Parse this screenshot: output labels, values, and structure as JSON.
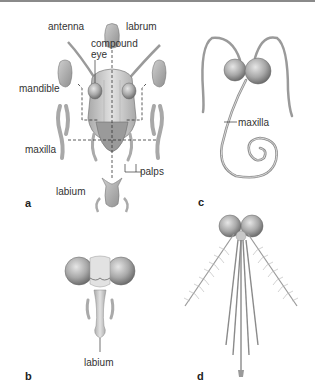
{
  "figure": {
    "panels": [
      {
        "id": "a",
        "label": "a",
        "labels": {
          "antenna": "antenna",
          "labrum": "labrum",
          "compound_eye_1": "compound",
          "compound_eye_2": "eye",
          "mandible": "mandible",
          "maxilla": "maxilla",
          "palps": "palps",
          "labium": "labium"
        }
      },
      {
        "id": "b",
        "label": "b",
        "labels": {
          "labium": "labium"
        }
      },
      {
        "id": "c",
        "label": "c",
        "labels": {
          "maxilla": "maxilla"
        }
      },
      {
        "id": "d",
        "label": "d",
        "labels": {}
      }
    ],
    "colors": {
      "line": "#333333",
      "fill_light": "#d8d8d8",
      "fill_mid": "#b5b5b5",
      "fill_dark": "#8c8c8c",
      "topline": "#8a8a8a"
    }
  }
}
